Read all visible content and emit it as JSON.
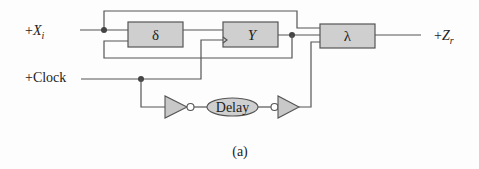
{
  "diagram": {
    "inputs": {
      "x_prefix": "+",
      "x_var": "X",
      "x_sub": "i",
      "clock": "+Clock"
    },
    "output": {
      "prefix": "+",
      "var": "Z",
      "sub": "r"
    },
    "blocks": {
      "delta": "δ",
      "y": "Y",
      "lambda": "λ"
    },
    "delay_label": "Delay",
    "caption": "(a)"
  }
}
